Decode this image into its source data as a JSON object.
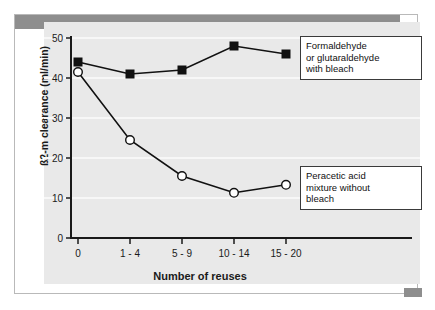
{
  "chart_data": {
    "type": "line",
    "title": "",
    "xlabel": "Number of reuses",
    "ylabel": "ß2-m clearance (ml/min)",
    "categories": [
      "0",
      "1 - 4",
      "5 - 9",
      "10 - 14",
      "15 - 20"
    ],
    "ylim": [
      0,
      50
    ],
    "yticks": [
      "0",
      "10",
      "20",
      "30",
      "40",
      "50"
    ],
    "ytick_values": [
      0,
      10,
      20,
      30,
      40,
      50
    ],
    "grid": true,
    "legend_position": "inside-right-annotations",
    "series": [
      {
        "name": "Formaldehyde or glutaraldehyde with bleach",
        "marker": "filled-square",
        "values": [
          44,
          41,
          42,
          48,
          46
        ]
      },
      {
        "name": "Peracetic acid mixture without bleach",
        "marker": "open-circle",
        "values": [
          41.5,
          24.5,
          15.5,
          11.3,
          13.3
        ]
      }
    ],
    "annotations": [
      {
        "id": "formaldehyde-note",
        "text": "Formaldehyde\nor glutaraldehyde\nwith bleach"
      },
      {
        "id": "peracetic-note",
        "text": "Peracetic acid\nmixture without\nbleach"
      }
    ],
    "colors": {
      "panel_background": "#e9e9e9",
      "gridline": "#f7f7f7",
      "axis": "#1a1a1a",
      "series_line": "#111111",
      "marker_fill_series1": "#111111",
      "marker_fill_series2": "#ffffff",
      "decor_grey": "#8e8e8e",
      "card_border": "#b9b9b9"
    }
  }
}
